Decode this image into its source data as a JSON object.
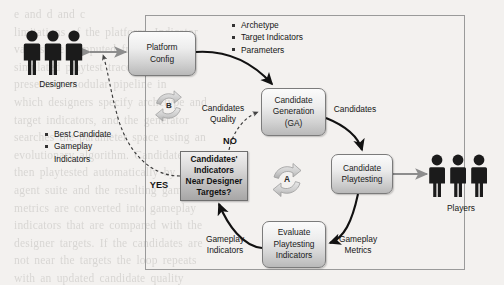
{
  "figure": {
    "background_text": "e and d and c\nlimitations of the platform. Indicator\nvalues are computed from the\nsimulated playtest traces. Our work\npresents a modular pipeline in\nwhich designers specify archetype and\ntarget indicators, and the generator\nsearches the parameter space using an\nevolutionary algorithm. Candidates are\nthen playtested automatically by the\nagent suite and the resulting gameplay\nmetrics are converted into gameplay\nindicators that are compared with the\ndesigner targets. If the candidates are\nnot near the targets the loop repeats\nwith an updated candidate quality\nsignal; otherwise the best candidate\nand its gameplay indicators are\nreturned to the designers for the next\niteration of the design process."
  },
  "nodes": {
    "platform_config": "Platform\nConfig",
    "candidate_generation": "Candidate\nGeneration\n(GA)",
    "candidate_playtesting": "Candidate\nPlaytesting",
    "evaluate_playtesting": "Evaluate\nPlaytesting\nIndicators",
    "decision": "Candidates'\nIndicators\nNear Designer\nTargets?"
  },
  "loop_badges": {
    "inner": "A",
    "outer": "B"
  },
  "edge_labels": {
    "candidates": "Candidates",
    "gameplay_metrics": "Gameplay\nMetrics",
    "gameplay_indicators": "Gameplay\nIndicators",
    "candidates_quality": "Candidates\nQuality",
    "no": "NO",
    "yes": "YES"
  },
  "bullet_lists": {
    "config_inputs": [
      "Archetype",
      "Target Indicators",
      "Parameters"
    ],
    "designer_outputs": [
      "Best Candidate",
      "Gameplay\nIndicators"
    ]
  },
  "actors": {
    "designers": {
      "label": "Designers",
      "count": 3
    },
    "players": {
      "label": "Players",
      "count": 3
    }
  },
  "colors": {
    "page_background": "#f3f1ef",
    "node_border": "#7b7b7b",
    "arrow_black": "#111111",
    "arrow_gray": "#8d8d8d",
    "frame_border": "#9a9a9a",
    "figure_icon": "#1b1b1b"
  }
}
